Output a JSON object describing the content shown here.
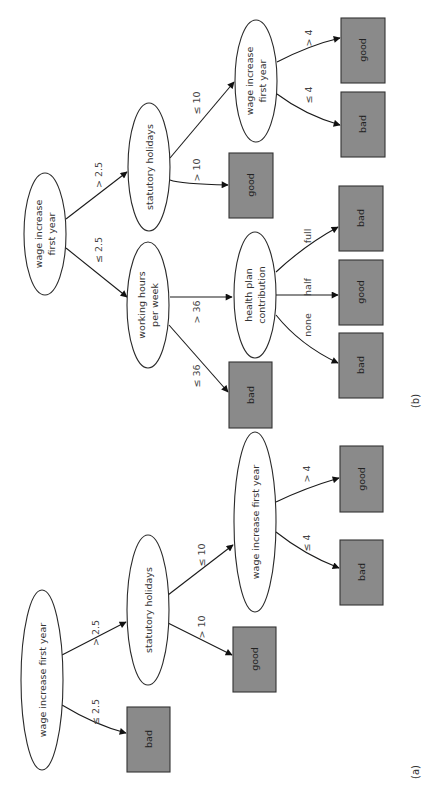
{
  "figure": {
    "orientation": "rotated 90 degrees counterclockwise",
    "leaf_fill_color": "#8a8a8a",
    "node_fill_color": "#ffffff"
  },
  "tree_a": {
    "caption": "(a)",
    "root": {
      "label": "wage increase first year"
    },
    "edges": {
      "root_le": "≤ 2.5",
      "root_gt": "> 2.5",
      "stat_gt": "> 10",
      "stat_le": "≤ 10",
      "wage_le": "≤ 4",
      "wage_gt": "> 4"
    },
    "nodes": {
      "statutory": "statutory holidays",
      "wage2": "wage increase first year"
    },
    "leaves": {
      "root_le": "bad",
      "stat_gt": "good",
      "wage_le": "bad",
      "wage_gt": "good"
    }
  },
  "tree_b": {
    "caption": "(b)",
    "root": {
      "line1": "wage increase",
      "line2": "first year"
    },
    "edges": {
      "root_le": "≤ 2.5",
      "root_gt": "> 2.5",
      "hours_le": "≤ 36",
      "hours_gt": "> 36",
      "health_none": "none",
      "health_half": "half",
      "health_full": "full",
      "stat_gt": "> 10",
      "stat_le": "≤ 10",
      "wage_le": "≤ 4",
      "wage_gt": "> 4"
    },
    "nodes": {
      "hours_line1": "working hours",
      "hours_line2": "per week",
      "health_line1": "health plan",
      "health_line2": "contribution",
      "statutory": "statutory holidays",
      "wage2_line1": "wage increase",
      "wage2_line2": "first year"
    },
    "leaves": {
      "hours_le": "bad",
      "health_none": "bad",
      "health_half": "good",
      "health_full": "bad",
      "stat_gt": "good",
      "wage_le": "bad",
      "wage_gt": "good"
    }
  }
}
